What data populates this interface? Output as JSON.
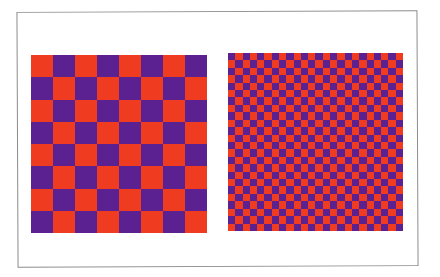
{
  "figure": {
    "frame": {
      "border_color": "#8c8c8c"
    },
    "colors": {
      "red": "#ef3b1f",
      "purple": "#5b2190"
    },
    "boards": [
      {
        "id": "board-coarse",
        "label": "coarse checkerboard",
        "rows": 8,
        "cols": 8,
        "top_left_color": "red"
      },
      {
        "id": "board-fine",
        "label": "fine checkerboard",
        "rows": 24,
        "cols": 24,
        "top_left_color": "purple"
      }
    ]
  }
}
